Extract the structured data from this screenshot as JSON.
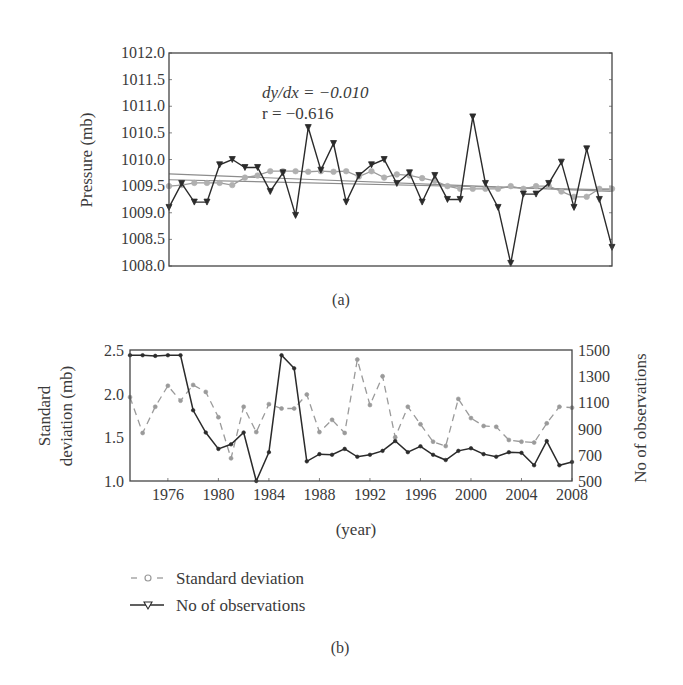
{
  "colors": {
    "black_series": "#2b2b2b",
    "grey_series": "#9a9a9a",
    "trend_line": "#8c8c8c",
    "frame": "#444444",
    "text": "#3a3a3a"
  },
  "panel_a": {
    "caption": "(a)",
    "ylabel": "Pressure (mb)",
    "annotation_slope": "dy/dx = −0.010",
    "annotation_r": "r = −0.616"
  },
  "panel_b": {
    "caption": "(b)",
    "xlabel": "(year)",
    "ylabel_left_line1": "Standard",
    "ylabel_left_line2": "deviation (mb)",
    "ylabel_right": "No of observations",
    "legend": [
      {
        "label": "Standard deviation",
        "style": "dashed-circle"
      },
      {
        "label": "No of observations",
        "style": "solid-triangle"
      }
    ]
  },
  "chart_data": [
    {
      "type": "line",
      "title": "(a)",
      "xlabel": "",
      "ylabel": "Pressure (mb)",
      "xlim": [
        1973,
        2008
      ],
      "ylim": [
        1008.0,
        1012.0
      ],
      "yticks": [
        "1008.0",
        "1008.5",
        "1009.0",
        "1009.5",
        "1010.0",
        "1010.5",
        "1011.0",
        "1011.5",
        "1012.0"
      ],
      "grid": false,
      "annotations": [
        "dy/dx = −0.010",
        "r = −0.616"
      ],
      "x": [
        1973,
        1974,
        1975,
        1976,
        1977,
        1978,
        1979,
        1980,
        1981,
        1982,
        1983,
        1984,
        1985,
        1986,
        1987,
        1988,
        1989,
        1990,
        1991,
        1992,
        1993,
        1994,
        1995,
        1996,
        1997,
        1998,
        1999,
        2000,
        2001,
        2002,
        2003,
        2004,
        2005,
        2006,
        2007,
        2008
      ],
      "series": [
        {
          "name": "Annual mean pressure",
          "marker": "triangle",
          "color": "#2b2b2b",
          "values": [
            1009.1,
            1009.55,
            1009.2,
            1009.2,
            1009.9,
            1010.0,
            1009.85,
            1009.85,
            1009.4,
            1009.75,
            1008.95,
            1010.6,
            1009.8,
            1010.3,
            1009.2,
            1009.7,
            1009.9,
            1010.0,
            1009.55,
            1009.75,
            1009.2,
            1009.7,
            1009.25,
            1009.25,
            1010.8,
            1009.55,
            1009.1,
            1008.05,
            1009.35,
            1009.35,
            1009.55,
            1009.95,
            1009.1,
            1010.2,
            1009.25,
            1008.35,
            null
          ]
        },
        {
          "name": "Smoothed pressure",
          "marker": "circle",
          "color": "#9a9a9a",
          "values": [
            1009.5,
            1009.52,
            1009.56,
            1009.56,
            1009.56,
            1009.52,
            1009.66,
            1009.7,
            1009.78,
            1009.78,
            1009.78,
            1009.77,
            1009.78,
            1009.77,
            1009.78,
            1009.68,
            1009.78,
            1009.66,
            1009.72,
            1009.7,
            1009.65,
            1009.6,
            1009.5,
            1009.45,
            1009.45,
            1009.45,
            1009.45,
            1009.5,
            1009.45,
            1009.5,
            1009.5,
            1009.4,
            1009.3,
            1009.3,
            1009.45,
            1009.45
          ]
        },
        {
          "name": "Linear trend (mean)",
          "marker": "none",
          "color": "#8c8c8c",
          "values_endpoints": [
            1009.73,
            1009.4
          ]
        },
        {
          "name": "Linear trend (smoothed)",
          "marker": "none",
          "color": "#8c8c8c",
          "values_endpoints": [
            1009.62,
            1009.43
          ]
        }
      ]
    },
    {
      "type": "line",
      "title": "(b)",
      "xlabel": "(year)",
      "ylabel": "Standard deviation (mb)",
      "ylabel_right": "No of observations",
      "xlim": [
        1973,
        2008
      ],
      "xticks": [
        "1976",
        "1980",
        "1984",
        "1988",
        "1992",
        "1996",
        "2000",
        "2004",
        "2008"
      ],
      "ylim": [
        1.0,
        2.5
      ],
      "yticks": [
        "1.0",
        "1.5",
        "2.0",
        "2.5"
      ],
      "ylim_right": [
        500,
        1500
      ],
      "yticks_right": [
        "500",
        "700",
        "900",
        "1100",
        "1300",
        "1500"
      ],
      "legend_position": "below",
      "grid": false,
      "x": [
        1973,
        1974,
        1975,
        1976,
        1977,
        1978,
        1979,
        1980,
        1981,
        1982,
        1983,
        1984,
        1985,
        1986,
        1987,
        1988,
        1989,
        1990,
        1991,
        1992,
        1993,
        1994,
        1995,
        1996,
        1997,
        1998,
        1999,
        2000,
        2001,
        2002,
        2003,
        2004,
        2005,
        2006,
        2007,
        2008
      ],
      "series": [
        {
          "name": "Standard deviation",
          "axis": "left",
          "style": "dashed",
          "marker": "circle",
          "color": "#9a9a9a",
          "values": [
            1.96,
            1.55,
            1.85,
            2.09,
            1.92,
            2.1,
            2.02,
            1.73,
            1.26,
            1.85,
            1.56,
            1.88,
            1.83,
            1.83,
            1.99,
            1.56,
            1.7,
            1.55,
            2.39,
            1.87,
            2.2,
            1.5,
            1.85,
            1.65,
            1.45,
            1.4,
            1.94,
            1.72,
            1.63,
            1.62,
            1.47,
            1.45,
            1.44,
            1.66,
            1.85,
            1.84
          ]
        },
        {
          "name": "No of observations",
          "axis": "right",
          "style": "solid",
          "marker": "triangle",
          "color": "#2b2b2b",
          "values": [
            1460,
            1460,
            1455,
            1460,
            1460,
            1040,
            870,
            745,
            780,
            870,
            500,
            720,
            1460,
            1360,
            650,
            705,
            700,
            745,
            685,
            700,
            730,
            805,
            720,
            765,
            700,
            660,
            730,
            750,
            705,
            685,
            720,
            715,
            620,
            805,
            620,
            645
          ]
        }
      ]
    }
  ]
}
